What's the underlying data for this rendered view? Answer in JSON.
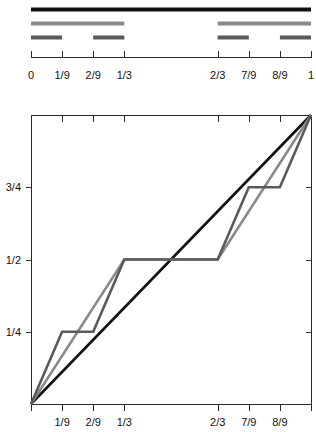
{
  "figure": {
    "title": "",
    "width": 316,
    "height": 432
  },
  "colors": {
    "level0": "#111111",
    "level1": "#8a8a8a",
    "level2": "#5a5a5a",
    "identity": "#111111",
    "axis": "#2a2a2a",
    "background": "#ffffff",
    "text": "#111111"
  },
  "cantor_construction": {
    "caption": "",
    "x_axis": {
      "tick_values": [
        0,
        0.1111,
        0.2222,
        0.3333,
        0.6667,
        0.7778,
        0.8889,
        1
      ],
      "tick_labels": [
        "0",
        "1/9",
        "2/9",
        "1/3",
        "2/3",
        "7/9",
        "8/9",
        "1"
      ],
      "range": [
        0,
        1
      ]
    },
    "rows": [
      {
        "name": "level-0",
        "color_key": "level0",
        "thickness": 4,
        "segments": [
          [
            0,
            1
          ]
        ]
      },
      {
        "name": "level-1",
        "color_key": "level1",
        "thickness": 4,
        "segments": [
          [
            0,
            0.3333
          ],
          [
            0.6667,
            1
          ]
        ]
      },
      {
        "name": "level-2",
        "color_key": "level2",
        "thickness": 4,
        "segments": [
          [
            0,
            0.1111
          ],
          [
            0.2222,
            0.3333
          ],
          [
            0.6667,
            0.7778
          ],
          [
            0.8889,
            1
          ]
        ]
      }
    ]
  },
  "chart_data": {
    "type": "line",
    "title": "",
    "xlabel": "",
    "ylabel": "",
    "xlim": [
      0,
      1
    ],
    "ylim": [
      0,
      1
    ],
    "grid": false,
    "legend": "none",
    "x_ticks": {
      "values": [
        0,
        0.1111,
        0.2222,
        0.3333,
        0.6667,
        0.7778,
        0.8889,
        1
      ],
      "labels": [
        "",
        "1/9",
        "2/9",
        "1/3",
        "2/3",
        "7/9",
        "8/9",
        ""
      ]
    },
    "y_ticks": {
      "values": [
        0.25,
        0.5,
        0.75
      ],
      "labels": [
        "1/4",
        "1/2",
        "3/4"
      ]
    },
    "series": [
      {
        "name": "identity",
        "color_key": "identity",
        "width": 2.6,
        "points": [
          [
            0,
            0
          ],
          [
            1,
            1
          ]
        ]
      },
      {
        "name": "cantor-approx-1",
        "color_key": "level1",
        "width": 2.6,
        "points": [
          [
            0,
            0
          ],
          [
            0.3333,
            0.5
          ],
          [
            0.6667,
            0.5
          ],
          [
            1,
            1
          ]
        ]
      },
      {
        "name": "cantor-approx-2",
        "color_key": "level2",
        "width": 2.6,
        "points": [
          [
            0,
            0
          ],
          [
            0.1111,
            0.25
          ],
          [
            0.2222,
            0.25
          ],
          [
            0.3333,
            0.5
          ],
          [
            0.6667,
            0.5
          ],
          [
            0.7778,
            0.75
          ],
          [
            0.8889,
            0.75
          ],
          [
            1,
            1
          ]
        ]
      }
    ]
  }
}
